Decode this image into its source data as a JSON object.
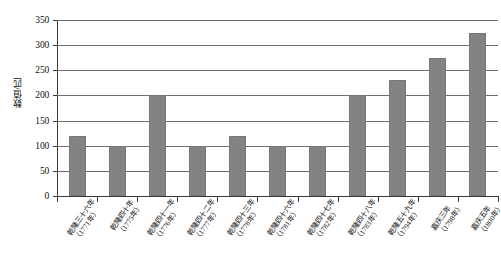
{
  "chart_data": {
    "type": "bar",
    "title": "",
    "xlabel": "",
    "ylabel": "数值/匹",
    "ylim": [
      0,
      350
    ],
    "ytick_values": [
      350,
      300,
      250,
      200,
      150,
      100,
      50,
      0
    ],
    "ytick_labels": [
      "350",
      "300",
      "250",
      "200",
      "150",
      "100",
      "50",
      "0"
    ],
    "grid": true,
    "legend": "none",
    "bar_color": "#838383",
    "axis_color": "#3a3a3a",
    "gridline_color": "#6e6e6e",
    "categories": [
      "乾隆三十六年（1771年）",
      "乾隆四十年（1775年）",
      "乾隆四十一年（1776年）",
      "乾隆四十二年（1777年）",
      "乾隆四十三年（1778年）",
      "乾隆四十六年（1781年）",
      "乾隆四十七年（1782年）",
      "乾隆四十八年（1783年）",
      "乾隆五十九年（1794年）",
      "嘉庆三年（1798年）",
      "嘉庆五年（1800年）"
    ],
    "category_lines": [
      {
        "line1": "乾隆三十六年",
        "line2": "（1771年）"
      },
      {
        "line1": "乾隆四十年",
        "line2": "（1775年）"
      },
      {
        "line1": "乾隆四十一年",
        "line2": "（1776年）"
      },
      {
        "line1": "乾隆四十二年",
        "line2": "（1777年）"
      },
      {
        "line1": "乾隆四十三年",
        "line2": "（1778年）"
      },
      {
        "line1": "乾隆四十六年",
        "line2": "（1781年）"
      },
      {
        "line1": "乾隆四十七年",
        "line2": "（1782年）"
      },
      {
        "line1": "乾隆四十八年",
        "line2": "（1783年）"
      },
      {
        "line1": "乾隆五十九年",
        "line2": "（1794年）"
      },
      {
        "line1": "嘉庆三年",
        "line2": "（1798年）"
      },
      {
        "line1": "嘉庆五年",
        "line2": "（1800年）"
      }
    ],
    "values": [
      120,
      100,
      200,
      100,
      120,
      100,
      100,
      200,
      230,
      275,
      325
    ]
  }
}
